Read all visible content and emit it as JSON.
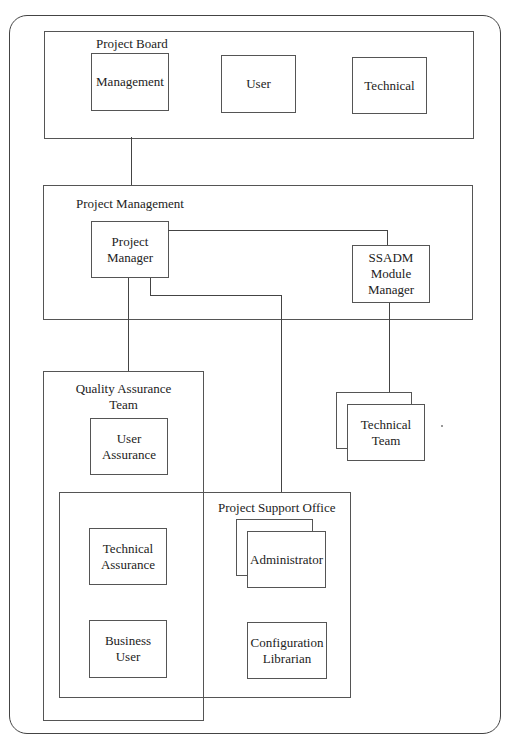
{
  "diagram": {
    "groups": {
      "project_board": {
        "label": "Project Board",
        "members": [
          "Management",
          "User",
          "Technical"
        ]
      },
      "project_management": {
        "label": "Project Management",
        "members": [
          "Project\nManager",
          "SSADM\nModule\nManager"
        ]
      },
      "quality_assurance": {
        "label": "Quality Assurance\nTeam",
        "members": [
          "User\nAssurance",
          "Technical\nAssurance",
          "Business\nUser"
        ]
      },
      "project_support": {
        "label": "Project Support Office",
        "members": [
          "Administrator",
          "Configuration\nLibrarian"
        ]
      }
    },
    "standalone": {
      "technical_team": "Technical\nTeam"
    },
    "connections": [
      [
        "Project Board",
        "Project Management"
      ],
      [
        "Project Manager",
        "SSADM Module Manager"
      ],
      [
        "Project Manager",
        "Quality Assurance Team"
      ],
      [
        "Project Manager",
        "Project Support Office"
      ],
      [
        "SSADM Module Manager",
        "Technical Team"
      ]
    ]
  }
}
